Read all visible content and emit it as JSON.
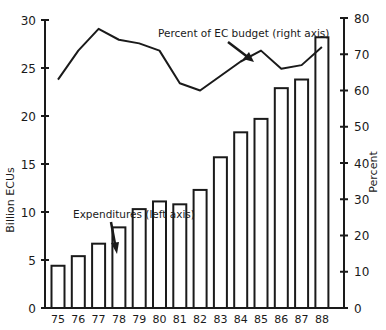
{
  "chart_data": {
    "type": "bar+line",
    "title": "",
    "categories": [
      "75",
      "76",
      "77",
      "78",
      "79",
      "80",
      "81",
      "82",
      "83",
      "84",
      "85",
      "86",
      "87",
      "88"
    ],
    "series": [
      {
        "name": "Expenditures (left axis)",
        "type": "bar",
        "axis": "left",
        "values": [
          4.4,
          5.4,
          6.7,
          8.4,
          10.3,
          11.1,
          10.8,
          12.3,
          15.7,
          18.3,
          19.7,
          22.9,
          23.8,
          28.2
        ]
      },
      {
        "name": "Percent of EC budget (right axis)",
        "type": "line",
        "axis": "right",
        "values": [
          63,
          71,
          77,
          74,
          73,
          71,
          62,
          60,
          64,
          68,
          71,
          66,
          67,
          72
        ]
      }
    ],
    "left_axis": {
      "label": "Billion ECUs",
      "ticks": [
        0,
        5,
        10,
        15,
        20,
        25,
        30
      ],
      "ylim": [
        0,
        30
      ]
    },
    "right_axis": {
      "label": "Percent",
      "ticks": [
        0,
        10,
        20,
        30,
        40,
        50,
        60,
        70,
        80
      ],
      "ylim": [
        0,
        80
      ]
    },
    "xlabel": "",
    "annotations": [
      {
        "text": "Percent of EC budget (right axis)",
        "points_to": "line near 84"
      },
      {
        "text": "Expenditures (left axis)",
        "points_to": "bar 78"
      }
    ],
    "grid": false,
    "legend": "none"
  },
  "colors": {
    "ink": "#1a1a1a",
    "bar_fill": "#ffffff",
    "background": "#ffffff"
  }
}
